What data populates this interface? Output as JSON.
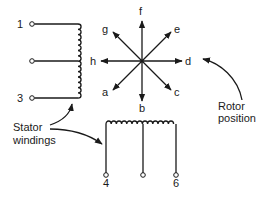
{
  "diagram": {
    "type": "stepper-motor-schematic",
    "stator_labels": {
      "text_line1": "Stator",
      "text_line2": "windings"
    },
    "rotor_label": {
      "text_line1": "Rotor",
      "text_line2": "position"
    },
    "vertical_winding": {
      "terminals": [
        {
          "id": "t1",
          "label": "1"
        },
        {
          "id": "t2",
          "label": ""
        },
        {
          "id": "t3",
          "label": "3"
        }
      ]
    },
    "horizontal_winding": {
      "terminals": [
        {
          "id": "t4",
          "label": "4"
        },
        {
          "id": "t5",
          "label": ""
        },
        {
          "id": "t6",
          "label": "6"
        }
      ]
    },
    "rotor_positions": [
      {
        "id": "a",
        "label": "a",
        "angle_deg": 225
      },
      {
        "id": "b",
        "label": "b",
        "angle_deg": 270
      },
      {
        "id": "c",
        "label": "c",
        "angle_deg": 315
      },
      {
        "id": "d",
        "label": "d",
        "angle_deg": 0
      },
      {
        "id": "e",
        "label": "e",
        "angle_deg": 45
      },
      {
        "id": "f",
        "label": "f",
        "angle_deg": 90
      },
      {
        "id": "g",
        "label": "g",
        "angle_deg": 135
      },
      {
        "id": "h",
        "label": "h",
        "angle_deg": 180
      }
    ],
    "colors": {
      "ink": "#1a1a1a",
      "background": "#ffffff"
    }
  }
}
